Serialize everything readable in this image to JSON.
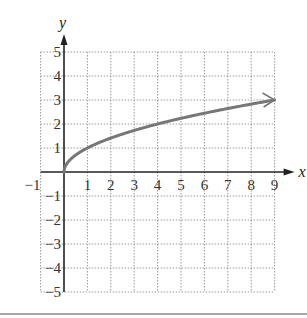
{
  "chart_data": {
    "type": "line",
    "title": "",
    "function": "y = sqrt(x)",
    "xlabel": "x",
    "ylabel": "y",
    "xlim": [
      -1,
      9
    ],
    "ylim": [
      -5,
      5
    ],
    "grid": true,
    "grid_style": "dotted",
    "x_ticks": [
      "-1",
      "1",
      "2",
      "3",
      "4",
      "5",
      "6",
      "7",
      "8",
      "9"
    ],
    "y_ticks": [
      "5",
      "4",
      "3",
      "2",
      "1",
      "-1",
      "-2",
      "-3",
      "-4",
      "-5"
    ],
    "series": [
      {
        "name": "sqrt(x)",
        "color": "#777777",
        "x": [
          0,
          0.25,
          0.5,
          1,
          2,
          3,
          4,
          5,
          6,
          7,
          8,
          9
        ],
        "y": [
          0,
          0.5,
          0.71,
          1,
          1.41,
          1.73,
          2,
          2.24,
          2.45,
          2.65,
          2.83,
          3
        ],
        "end_arrow": true
      }
    ],
    "legend": null
  },
  "labels": {
    "x_axis": "x",
    "y_axis": "y"
  }
}
